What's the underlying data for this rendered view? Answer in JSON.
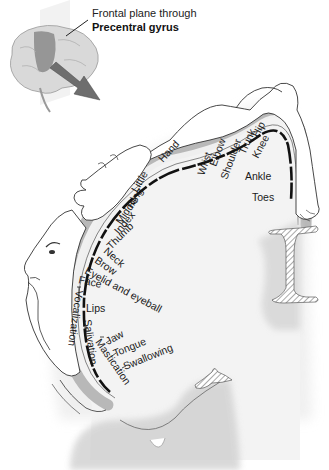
{
  "figure": {
    "caption": {
      "line1": "Frontal plane through",
      "line2": "Precentral gyrus"
    },
    "colors": {
      "background": "#ffffff",
      "cortex_fill": "#f3f3f3",
      "gyrus_band": "#b8b8b8",
      "motor_strip": "#111111",
      "arrow": "#6e6e6e",
      "brain_highlight": "#8a8a8a",
      "brain_base": "#d9d9d9"
    },
    "body_labels": {
      "toes": "Toes",
      "ankle": "Ankle",
      "knee": "Knee",
      "hip": "Hip",
      "trunk": "Trunk",
      "shoulder": "Shoulder",
      "elbow": "Elbow",
      "wrist": "Wrist",
      "hand": "Hand",
      "little": "Little",
      "ring": "Ring",
      "middle": "Middle",
      "index": "Index",
      "thumb": "Thumb",
      "neck": "Neck",
      "brow": "Brow",
      "eyelid": "Eyelid and eyeball",
      "face": "Face",
      "lips": "Lips",
      "jaw": "Jaw",
      "tongue": "Tongue",
      "swallowing": "Swallowing",
      "mastication": "Mastication",
      "salivation": "Salivation",
      "vocalization": "Vocalization"
    }
  }
}
